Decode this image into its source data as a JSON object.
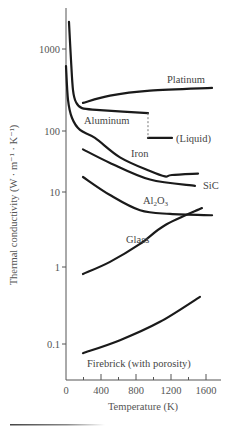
{
  "chart_data": {
    "type": "line",
    "title": "",
    "xlabel": "Temperature (K)",
    "ylabel": "Thermal conductivity (W · m⁻¹ · K⁻¹)",
    "xscale": "linear",
    "yscale": "log",
    "xlim": [
      0,
      1750
    ],
    "ylim": [
      0.06,
      3000
    ],
    "grid": false,
    "legend": "none (inline curve labels)",
    "x_ticks": [
      0,
      400,
      800,
      1200,
      1600
    ],
    "x_tick_labels": [
      "0",
      "400",
      "800",
      "1200",
      "1600"
    ],
    "y_ticks": [
      1000,
      100,
      10,
      1,
      0.1
    ],
    "y_tick_labels": [
      "1000",
      "100",
      "10",
      "1",
      "0.1"
    ],
    "series": [
      {
        "name": "Platinum",
        "label": "Platinum",
        "x": [
          194,
          503,
          960,
          1669
        ],
        "y": [
          220,
          270,
          310,
          335
        ]
      },
      {
        "name": "Aluminum",
        "label": "Aluminum",
        "x": [
          34,
          57,
          80,
          114,
          183,
          389,
          937
        ],
        "y": [
          2140,
          740,
          316,
          225,
          190,
          180,
          165
        ]
      },
      {
        "name": "Aluminum (Liquid)",
        "label": "(Liquid)",
        "x": [
          937,
          1211
        ],
        "y": [
          77,
          77
        ],
        "note": "dashed vertical drop at melting point ~933 K"
      },
      {
        "name": "Iron",
        "label": "Iron",
        "x": [
          0,
          23,
          69,
          160,
          331,
          617,
          960,
          1131,
          1211,
          1509
        ],
        "y": [
          620,
          240,
          144,
          103,
          77,
          37,
          22,
          18,
          19,
          20
        ]
      },
      {
        "name": "SiC",
        "label": "SiC",
        "x": [
          194,
          503,
          960,
          1474
        ],
        "y": [
          50,
          30,
          16,
          12.6
        ]
      },
      {
        "name": "Al2O3",
        "label": "Al₂O₃",
        "x": [
          194,
          503,
          846,
          1189,
          1669
        ],
        "y": [
          17.6,
          9.1,
          5.7,
          5.1,
          4.9
        ]
      },
      {
        "name": "Glass",
        "label": "Glass",
        "x": [
          194,
          503,
          846,
          1131,
          1554
        ],
        "y": [
          0.81,
          1.17,
          2.03,
          3.6,
          6.1
        ]
      },
      {
        "name": "Firebrick (with porosity)",
        "label": "Firebrick (with porosity)",
        "x": [
          194,
          617,
          1074,
          1531
        ],
        "y": [
          0.076,
          0.112,
          0.194,
          0.41
        ]
      }
    ]
  },
  "layout": {
    "x_origin_px": 66,
    "px_per_K": 0.0875,
    "y_tick_px": {
      "1000": 49,
      "100": 131,
      "10": 192,
      "1": 267,
      "0.1": 344
    },
    "axis_bottom_px": 380,
    "axis_top_px": 8
  }
}
